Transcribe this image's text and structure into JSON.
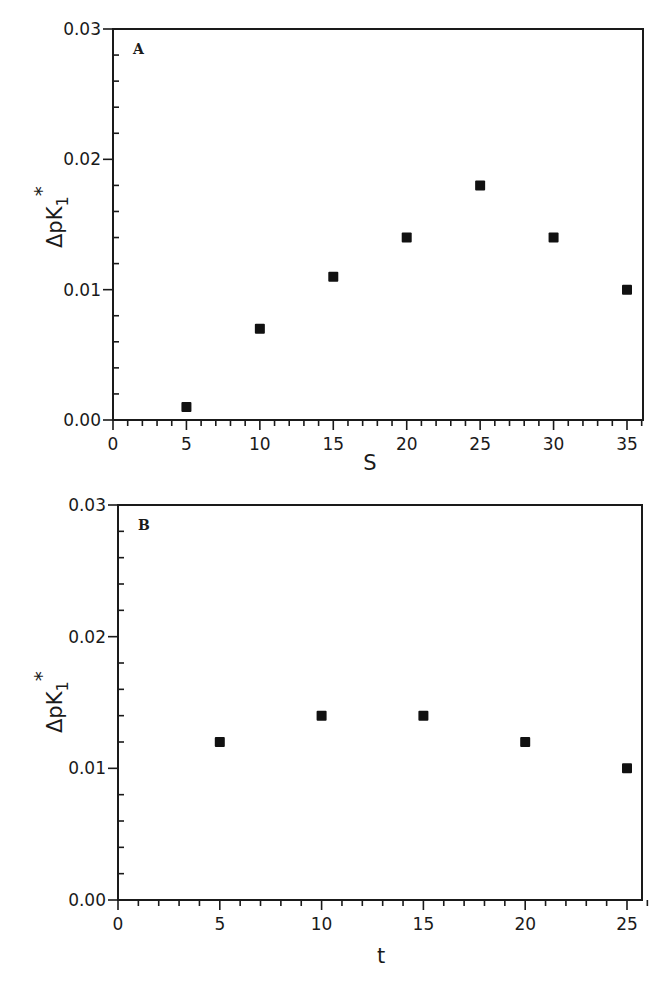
{
  "chart_data": [
    {
      "type": "scatter",
      "panel_label": "A",
      "title": "",
      "xlabel": "S",
      "ylabel": "ΔpK1*",
      "xlim": [
        0,
        36
      ],
      "ylim": [
        0.0,
        0.03
      ],
      "x_ticks": [
        0,
        5,
        10,
        15,
        20,
        25,
        30,
        35
      ],
      "x_tick_labels": [
        "0",
        "5",
        "10",
        "15",
        "20",
        "25",
        "30",
        "35"
      ],
      "y_ticks": [
        0.0,
        0.01,
        0.02,
        0.03
      ],
      "y_tick_labels": [
        "0.00",
        "0.01",
        "0.02",
        "0.03"
      ],
      "grid": false,
      "legend": null,
      "marker": "filled-square",
      "series": [
        {
          "name": "ΔpK1* vs S",
          "x": [
            5,
            10,
            15,
            20,
            25,
            30,
            35
          ],
          "values": [
            0.001,
            0.007,
            0.011,
            0.014,
            0.018,
            0.014,
            0.01
          ]
        }
      ]
    },
    {
      "type": "scatter",
      "panel_label": "B",
      "title": "",
      "xlabel": "t",
      "ylabel": "ΔpK1*",
      "xlim": [
        0,
        26
      ],
      "ylim": [
        0.0,
        0.03
      ],
      "x_ticks": [
        0,
        5,
        10,
        15,
        20,
        25
      ],
      "x_tick_labels": [
        "0",
        "5",
        "10",
        "15",
        "20",
        "25"
      ],
      "y_ticks": [
        0.0,
        0.01,
        0.02,
        0.03
      ],
      "y_tick_labels": [
        "0.00",
        "0.01",
        "0.02",
        "0.03"
      ],
      "grid": false,
      "legend": null,
      "marker": "filled-square",
      "series": [
        {
          "name": "ΔpK1* vs t",
          "x": [
            5,
            10,
            15,
            20,
            25
          ],
          "values": [
            0.012,
            0.014,
            0.014,
            0.012,
            0.01
          ]
        }
      ]
    }
  ],
  "panels": {
    "a": {
      "label": "A",
      "xlabel": "S",
      "ylabel_main": "ΔpK",
      "ylabel_sub": "1",
      "ylabel_sup": "*"
    },
    "b": {
      "label": "B",
      "xlabel": "t",
      "ylabel_main": "ΔpK",
      "ylabel_sub": "1",
      "ylabel_sup": "*"
    }
  }
}
